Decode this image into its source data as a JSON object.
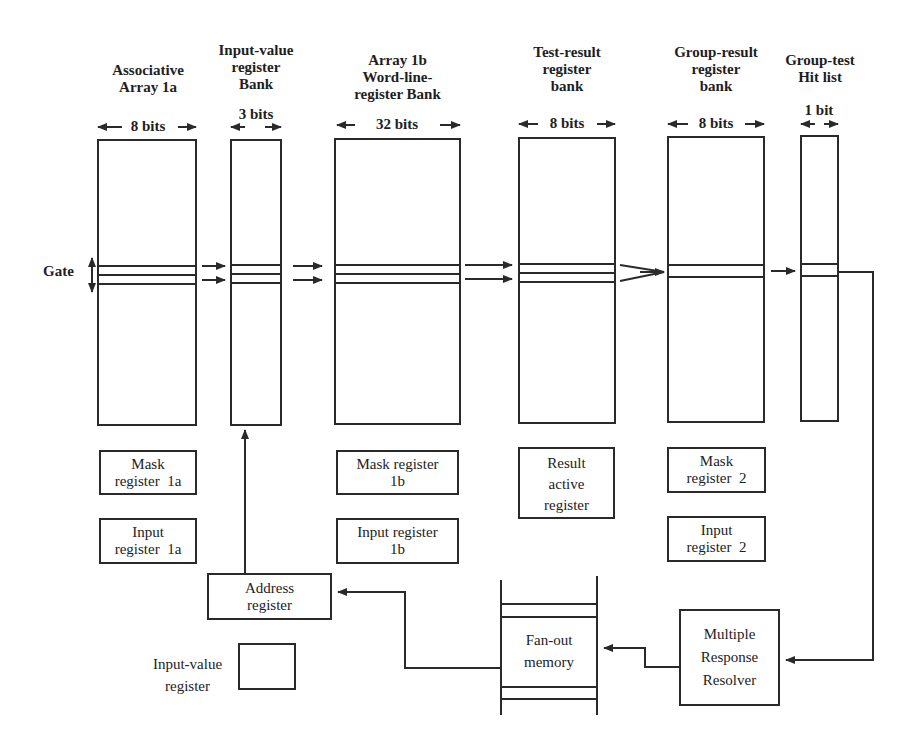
{
  "columns": [
    {
      "id": "assoc-1a",
      "title_lines": [
        "Associative",
        "Array 1a"
      ],
      "width_label": "8 bits"
    },
    {
      "id": "input-value-bank",
      "title_lines": [
        "Input-value",
        "register",
        "Bank"
      ],
      "width_label": "3 bits"
    },
    {
      "id": "array-1b",
      "title_lines": [
        "Array 1b",
        "Word-line-",
        "register Bank"
      ],
      "width_label": "32 bits"
    },
    {
      "id": "test-result",
      "title_lines": [
        "Test-result",
        "register",
        "bank"
      ],
      "width_label": "8 bits"
    },
    {
      "id": "group-result",
      "title_lines": [
        "Group-result",
        "register",
        "bank"
      ],
      "width_label": "8 bits"
    },
    {
      "id": "hit-list",
      "title_lines": [
        "Group-test",
        "Hit list"
      ],
      "width_label": "1 bit"
    }
  ],
  "gate_label": "Gate",
  "registers": {
    "mask_1a": [
      "Mask",
      "register  1a"
    ],
    "input_1a": [
      "Input",
      "register  1a"
    ],
    "mask_1b": [
      "Mask register",
      "1b"
    ],
    "input_1b": [
      "Input register",
      "1b"
    ],
    "result_active": [
      "Result",
      "active",
      "register"
    ],
    "mask_2": [
      "Mask",
      "register  2"
    ],
    "input_2": [
      "Input",
      "register  2"
    ],
    "address": [
      "Address",
      "register"
    ],
    "input_value": [
      "Input-value",
      "register"
    ],
    "fan_out": [
      "Fan-out",
      "memory"
    ],
    "mrr": [
      "Multiple",
      "Response",
      "Resolver"
    ]
  },
  "colors": {
    "line": "#2a2a2a",
    "background": "#ffffff"
  }
}
